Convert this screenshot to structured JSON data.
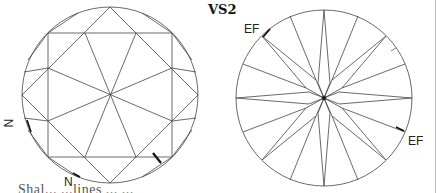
{
  "title": "VS2",
  "crown_view": {
    "label": "crown-view",
    "markings": [
      {
        "symbol": "N",
        "position": "left-lower-girdle"
      },
      {
        "symbol": "N",
        "position": "bottom-girdle"
      },
      {
        "symbol": "feather",
        "position": "lower-right-star-facet"
      }
    ]
  },
  "pavilion_view": {
    "label": "pavilion-view",
    "markings": [
      {
        "symbol": "EF",
        "position": "upper-left-girdle"
      },
      {
        "symbol": "EF",
        "position": "right-girdle"
      },
      {
        "symbol": "feather",
        "position": "upper-right-girdle"
      }
    ]
  },
  "labels": {
    "n_left": "N",
    "n_bottom": "N",
    "ef_top": "EF",
    "ef_right": "EF"
  },
  "caption": "Shal...   ...lines   ...   ...",
  "colors": {
    "line": "#444444",
    "background": "#ffffff",
    "mark": "#111111"
  }
}
